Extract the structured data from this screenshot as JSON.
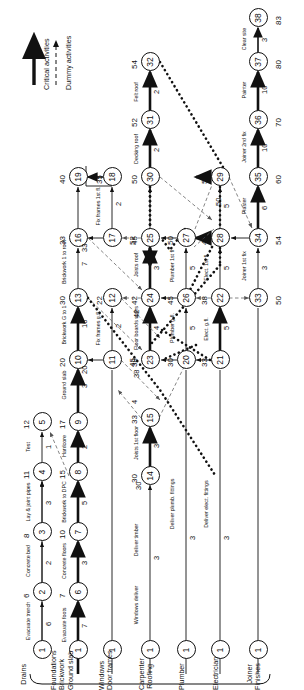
{
  "diagram": {
    "type": "activity-on-arrow-network",
    "orientation": "rotated-90-ccw"
  },
  "legend": {
    "critical_label": "Critical activities",
    "dummy_label": "Dummy activities"
  },
  "trades": [
    {
      "id": "drains",
      "lines": [
        "Drains"
      ]
    },
    {
      "id": "foundations",
      "lines": [
        "Foundations",
        "Brickwork",
        "Ground slab"
      ]
    },
    {
      "id": "windows",
      "lines": [
        "Windows",
        "Door frames"
      ]
    },
    {
      "id": "carpenter",
      "lines": [
        "Carpenter",
        "Roofing"
      ]
    },
    {
      "id": "plumber",
      "lines": [
        "Plumber"
      ]
    },
    {
      "id": "electrician",
      "lines": [
        "Electrician"
      ]
    },
    {
      "id": "joiner",
      "lines": [
        "Joiner",
        "Finishes"
      ]
    }
  ],
  "nodes": [
    {
      "id": 1,
      "event": "",
      "x": 40,
      "y": 42
    },
    {
      "id": 2,
      "event": "6",
      "x": 98,
      "y": 42
    },
    {
      "id": 3,
      "event": "8",
      "x": 158,
      "y": 42
    },
    {
      "id": 4,
      "event": "11",
      "x": 218,
      "y": 42
    },
    {
      "id": 5,
      "event": "12",
      "x": 268,
      "y": 42
    },
    {
      "id": 1.2,
      "event": "",
      "x": 40,
      "y": 78
    },
    {
      "id": 6,
      "event": "7",
      "x": 98,
      "y": 78
    },
    {
      "id": 7,
      "event": "10",
      "x": 158,
      "y": 78
    },
    {
      "id": 8,
      "event": "15",
      "x": 218,
      "y": 78
    },
    {
      "id": 9,
      "event": "17",
      "x": 268,
      "y": 78
    },
    {
      "id": 10,
      "event": "20",
      "x": 330,
      "y": 78
    },
    {
      "id": 13,
      "event": "30",
      "x": 392,
      "y": 78
    },
    {
      "id": 16,
      "event": "33",
      "x": 452,
      "y": 78
    },
    {
      "id": 19,
      "event": "40",
      "x": 513,
      "y": 78
    },
    {
      "id": 11,
      "event": "45",
      "x": 330,
      "y": 112
    },
    {
      "id": 12,
      "event": "22",
      "x": 392,
      "y": 112
    },
    {
      "id": 17,
      "event": "52",
      "x": 452,
      "y": 112
    },
    {
      "id": 18,
      "event": "35",
      "x": 513,
      "y": 112
    },
    {
      "id": 14,
      "event": "30",
      "x": 214,
      "y": 150
    },
    {
      "id": 15,
      "event": "33",
      "x": 272,
      "y": 150
    },
    {
      "id": 23,
      "event": "38",
      "x": 330,
      "y": 150
    },
    {
      "id": 24,
      "event": "42",
      "x": 392,
      "y": 150
    },
    {
      "id": 25,
      "event": "45",
      "x": 452,
      "y": 150
    },
    {
      "id": 30,
      "event": "50",
      "x": 513,
      "y": 150
    },
    {
      "id": 31,
      "event": "52",
      "x": 570,
      "y": 150
    },
    {
      "id": 32,
      "event": "54",
      "x": 628,
      "y": 150
    },
    {
      "id": 20,
      "event": "30",
      "x": 330,
      "y": 186
    },
    {
      "id": 26,
      "event": "45",
      "x": 392,
      "y": 186
    },
    {
      "id": 27,
      "event": "50",
      "x": 452,
      "y": 186
    },
    {
      "id": 21,
      "event": "33",
      "x": 330,
      "y": 220
    },
    {
      "id": 22,
      "event": "38",
      "x": 392,
      "y": 220
    },
    {
      "id": 28,
      "event": "45",
      "x": 452,
      "y": 220
    },
    {
      "id": 29,
      "event": "50",
      "x": 513,
      "y": 220
    },
    {
      "id": 33,
      "event": "50",
      "x": 392,
      "y": 258
    },
    {
      "id": 34,
      "event": "54",
      "x": 452,
      "y": 258
    },
    {
      "id": 35,
      "event": "60",
      "x": 513,
      "y": 258
    },
    {
      "id": 36,
      "event": "70",
      "x": 570,
      "y": 258
    },
    {
      "id": 37,
      "event": "80",
      "x": 628,
      "y": 258
    },
    {
      "id": 38,
      "event": "83",
      "x": 672,
      "y": 258
    }
  ],
  "activities": [
    {
      "from": 1,
      "to": 2,
      "name": "Evacuate trench",
      "duration": "6",
      "critical": false
    },
    {
      "from": 2,
      "to": 3,
      "name": "Concrete bed",
      "duration": "2",
      "critical": false
    },
    {
      "from": 3,
      "to": 4,
      "name": "Lay & joint pipes",
      "duration": "3",
      "critical": false
    },
    {
      "from": 4,
      "to": 5,
      "name": "Test",
      "duration": "1",
      "critical": false
    },
    {
      "from": 1,
      "to": 6,
      "name": "Evacuate foots",
      "duration": "7",
      "critical": true
    },
    {
      "from": 6,
      "to": 7,
      "name": "Concrete floors",
      "duration": "3",
      "critical": true
    },
    {
      "from": 7,
      "to": 8,
      "name": "Brickwork to DPC",
      "duration": "5",
      "critical": true
    },
    {
      "from": 8,
      "to": 9,
      "name": "Hardcore",
      "duration": "2",
      "critical": true
    },
    {
      "from": 9,
      "to": 10,
      "name": "Ground slab",
      "duration": "3",
      "critical": true
    },
    {
      "from": 10,
      "to": 13,
      "name": "Brickwork G to 1",
      "duration": "10",
      "critical": true
    },
    {
      "from": 13,
      "to": 16,
      "name": "Brickwork 1 to roof",
      "duration": "7",
      "critical": false
    },
    {
      "from": 10,
      "to": 11,
      "name": "",
      "duration": "20",
      "critical": false
    },
    {
      "from": 11,
      "to": 12,
      "name": "Fix frames g.fl.",
      "duration": "2",
      "critical": false
    },
    {
      "from": 16,
      "to": 17,
      "name": "",
      "duration": "33",
      "critical": false
    },
    {
      "from": 17,
      "to": 18,
      "name": "Fix frames 1st fl.",
      "duration": "2",
      "critical": false
    },
    {
      "from": 18,
      "to": 19,
      "name": "",
      "duration": "",
      "critical": false
    },
    {
      "from": 1,
      "to": 14,
      "name": "Deliver timber",
      "duration": "3",
      "critical": false
    },
    {
      "from": 14,
      "to": 15,
      "name": "Joists 1st floor",
      "duration": "3",
      "critical": true
    },
    {
      "from": 23,
      "to": 24,
      "name": "Floor boards stairs",
      "duration": "4",
      "critical": true
    },
    {
      "from": 24,
      "to": 25,
      "name": "Joists roof",
      "duration": "3",
      "critical": true
    },
    {
      "from": 25,
      "to": 30,
      "name": "",
      "duration": "",
      "critical": false
    },
    {
      "from": 30,
      "to": 31,
      "name": "Decking roof",
      "duration": "2",
      "critical": true
    },
    {
      "from": 31,
      "to": 32,
      "name": "Felt roof",
      "duration": "2",
      "critical": true
    },
    {
      "from": 20,
      "to": 26,
      "name": "Plumber g.fl.",
      "duration": "5",
      "critical": false
    },
    {
      "from": 26,
      "to": 27,
      "name": "Plumber 1st fl",
      "duration": "5",
      "critical": false
    },
    {
      "from": 1,
      "to": 20,
      "name": "Deliver plumb. fittings",
      "duration": "3",
      "critical": false
    },
    {
      "from": 21,
      "to": 22,
      "name": "Elect. g.fl.",
      "duration": "5",
      "critical": true
    },
    {
      "from": 22,
      "to": 28,
      "name": "Elect. 1st fl.",
      "duration": "5",
      "critical": false
    },
    {
      "from": 28,
      "to": 29,
      "name": "",
      "duration": "5",
      "critical": true
    },
    {
      "from": 1,
      "to": 21,
      "name": "Deliver elect. fittings",
      "duration": "3",
      "critical": false
    },
    {
      "from": 33,
      "to": 34,
      "name": "Joiner 1st fix",
      "duration": "3",
      "critical": false
    },
    {
      "from": 34,
      "to": 35,
      "name": "Plaster",
      "duration": "6",
      "critical": true
    },
    {
      "from": 35,
      "to": 36,
      "name": "Joiner 2nd fix",
      "duration": "10",
      "critical": true
    },
    {
      "from": 36,
      "to": 37,
      "name": "Painter",
      "duration": "10",
      "critical": true
    },
    {
      "from": 37,
      "to": 38,
      "name": "Clear site",
      "duration": "3",
      "critical": true
    },
    {
      "from": 29,
      "to": 30,
      "name": "",
      "duration": "50",
      "critical": false
    },
    {
      "from": 1,
      "to": 0,
      "name": "Windows deliver",
      "duration": "",
      "critical": false
    },
    {
      "from": 14,
      "to": 23,
      "name": "",
      "duration": "30",
      "critical": false
    },
    {
      "from": 15,
      "to": 0,
      "name": "",
      "duration": "4",
      "critical": false
    },
    {
      "from": 24,
      "to": 0,
      "name": "",
      "duration": "42",
      "critical": false
    },
    {
      "from": 23,
      "to": 0,
      "name": "",
      "duration": "38",
      "critical": false
    }
  ],
  "start_node_marks": [
    "1",
    "1",
    "1",
    "1",
    "1",
    "1",
    "1"
  ]
}
